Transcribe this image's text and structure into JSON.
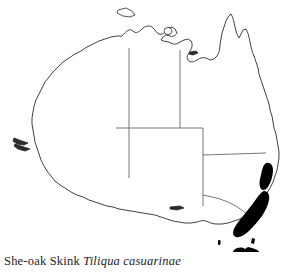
{
  "figure": {
    "type": "species-distribution-map",
    "region": "Australia",
    "caption": {
      "common_name": "She-oak Skink",
      "scientific_name": "Tiliqua casuarinae",
      "full_text": "She-oak Skink Tiliqua casuarinae"
    }
  },
  "colors": {
    "background": "#ffffff",
    "coastline": "#2b2b2b",
    "state_border": "#4a4a4a",
    "distribution_fill": "#000000",
    "caption_text": "#1a1a1a"
  },
  "map": {
    "outline_name": "australia-coastline",
    "states_shown": [
      "Western Australia",
      "Northern Territory",
      "South Australia",
      "Queensland",
      "New South Wales",
      "Victoria",
      "Tasmania"
    ],
    "islands": [
      {
        "name": "Melville Island",
        "label": "melville-island"
      },
      {
        "name": "Groote Eylandt",
        "label": "groote-eylandt"
      },
      {
        "name": "Kangaroo Island",
        "label": "kangaroo-island"
      },
      {
        "name": "King Island",
        "label": "king-island"
      },
      {
        "name": "Flinders Island",
        "label": "flinders-island"
      }
    ]
  },
  "distribution": {
    "legend_meaning": "solid black = recorded range",
    "areas": [
      {
        "name": "northern-tablelands-patch",
        "description": "narrow patch on the New South Wales northern coast"
      },
      {
        "name": "southeast-coastal-band",
        "description": "broad band along southeast New South Wales and eastern Victoria"
      },
      {
        "name": "tasmania",
        "description": "entire island of Tasmania filled"
      },
      {
        "name": "flinders-island-patch",
        "description": "small filled patch on Flinders Island"
      }
    ]
  },
  "shapes": {
    "australia_mainland": "M 126 33 L 131 28 L 136 30 L 140 27 L 147 27 L 152 31 L 159 32 L 163 29 L 168 31 L 170 27 L 174 26 L 176 30 L 181 32 L 186 30 L 190 33 L 193 29 L 197 28 L 199 33 L 203 35 L 206 32 L 210 34 L 211 40 L 208 45 L 210 50 L 207 54 L 209 58 L 206 60 L 203 57 L 199 58 L 196 56 L 193 59 L 190 57 L 186 59 L 183 57 L 179 59 L 176 57 L 173 60 L 176 63 L 180 62 L 185 64 L 189 62 L 194 64 L 198 62 L 201 64 L 204 62 L 207 64 L 209 61 L 212 57 L 213 52 L 212 46 L 214 41 L 213 35 L 215 29 L 214 23 L 216 17 L 219 13 L 221 17 L 222 23 L 224 28 L 226 24 L 228 19 L 231 16 L 233 20 L 234 26 L 236 31 L 239 35 L 241 41 L 244 46 L 247 50 L 249 56 L 252 61 L 254 67 L 257 72 L 259 78 L 262 84 L 264 90 L 266 96 L 268 102 L 270 108 L 272 114 L 274 120 L 276 126 L 278 132 L 279 138 L 280 144 L 281 150 L 281 156 L 280 162 L 278 168 L 276 174 L 273 180 L 270 186 L 267 191 L 263 196 L 259 201 L 255 206 L 250 211 L 245 215 L 240 219 L 234 222 L 228 225 L 222 227 L 216 228 L 210 228 L 204 227 L 198 226 L 192 226 L 186 227 L 180 227 L 174 226 L 168 224 L 162 222 L 156 220 L 150 218 L 144 217 L 138 216 L 132 215 L 126 214 L 120 213 L 114 212 L 108 211 L 102 209 L 96 207 L 90 205 L 84 203 L 78 200 L 72 197 L 66 194 L 61 190 L 56 186 L 52 181 L 48 176 L 45 170 L 42 164 L 40 158 L 38 152 L 36 146 L 34 140 L 33 134 L 32 128 L 31 122 L 31 116 L 32 110 L 34 104 L 36 98 L 39 92 L 42 86 L 46 80 L 50 75 L 55 70 L 60 65 L 66 61 L 72 57 L 78 53 L 84 50 L 90 46 L 96 43 L 102 40 L 108 37 L 114 35 L 120 34 Z"
  }
}
